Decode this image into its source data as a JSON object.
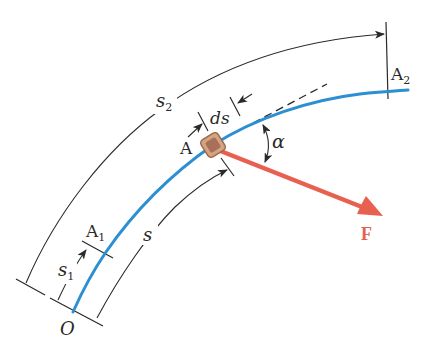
{
  "diagram": {
    "type": "kinematics-path-work",
    "colors": {
      "path": "#2b8fd1",
      "force": "#e8604f",
      "block_fill": "#c89473",
      "block_edge": "#9c6a4b",
      "block_inner": "#a8705a",
      "annotation": "#2a2a2a"
    },
    "labels": {
      "origin": "O",
      "point_a1_base": "A",
      "point_a1_sub": "1",
      "point_a": "A",
      "point_a2_base": "A",
      "point_a2_sub": "2",
      "arc_s": "s",
      "arc_s1_base": "s",
      "arc_s1_sub": "1",
      "arc_s2_base": "s",
      "arc_s2_sub": "2",
      "increment": "ds",
      "angle": "α",
      "force": "F"
    }
  }
}
